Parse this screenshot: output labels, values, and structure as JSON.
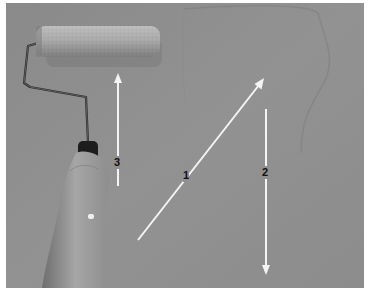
{
  "image": {
    "description": "Paint roller held by a hand next to a gray wall with numbered white arrows indicating rolling directions",
    "colors": {
      "wall": "#8f8f8f",
      "arrow": "#f4f4f4",
      "label": "#111111",
      "border": "#ffffff"
    }
  },
  "arrows": [
    {
      "label": "1",
      "direction": "diagonal-up-right"
    },
    {
      "label": "2",
      "direction": "down"
    },
    {
      "label": "3",
      "direction": "up"
    }
  ]
}
